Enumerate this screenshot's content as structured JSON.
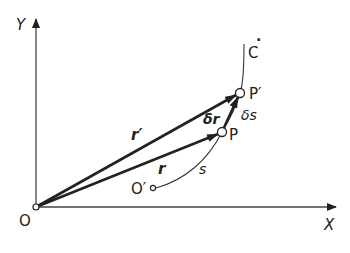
{
  "figure": {
    "colors": {
      "ink": "#222222",
      "background": "#ffffff"
    },
    "axes": {
      "x_label": "X",
      "y_label": "Y",
      "origin_label": "O"
    },
    "curve": {
      "label": "C",
      "dot": "·"
    },
    "points": {
      "p": "P",
      "p_prime": "P′",
      "o_prime": "O′"
    },
    "vectors": {
      "r": "r",
      "r_prime": "r′",
      "delta_r": "δr"
    },
    "arc": {
      "s": "s",
      "delta_s": "δs"
    }
  }
}
